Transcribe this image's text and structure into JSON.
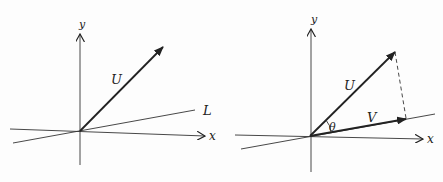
{
  "figure": {
    "left_panel": {
      "axis_labels": {
        "x": "x",
        "y": "y"
      },
      "vector_label": "U",
      "line_label": "L"
    },
    "right_panel": {
      "axis_labels": {
        "x": "x",
        "y": "y"
      },
      "vector_u_label": "U",
      "vector_v_label": "V",
      "angle_label": "θ"
    },
    "colors": {
      "ink": "#222222",
      "background": "#fdfdfd"
    }
  }
}
